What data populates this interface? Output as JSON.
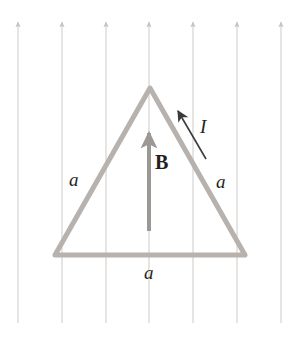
{
  "figure": {
    "width": 306,
    "height": 339,
    "background_color": "#ffffff"
  },
  "labels": {
    "side_left": "a",
    "side_right": "a",
    "side_bottom": "a",
    "current": "I",
    "field": "B"
  },
  "colors": {
    "loop_stroke": "#b7b2ae",
    "field_line": "#cfcbc9",
    "field_vector": "#9c9895",
    "text": "#231f20",
    "current_arrow": "#3a3a3c"
  },
  "geometry": {
    "triangle": {
      "apex": [
        150,
        88
      ],
      "bottom_left": [
        55,
        255
      ],
      "bottom_right": [
        245,
        255
      ],
      "stroke_width": 5
    },
    "field_lines": {
      "count": 7,
      "x_positions": [
        18,
        62,
        106,
        149,
        193,
        237,
        281
      ],
      "y_top": 22,
      "y_bottom": 323,
      "direction": "up",
      "stroke_width": 1
    },
    "field_vector": {
      "from": [
        149,
        231
      ],
      "to": [
        149,
        133
      ],
      "stroke_width": 4
    },
    "current_arrow": {
      "from": [
        206,
        159
      ],
      "to": [
        178,
        111
      ],
      "stroke_width": 1.6
    }
  },
  "icons": {
    "field_line_arrowhead": "arrow-up-icon",
    "field_vector_arrowhead": "arrow-up-icon",
    "current_arrowhead": "arrow-upleft-icon"
  }
}
